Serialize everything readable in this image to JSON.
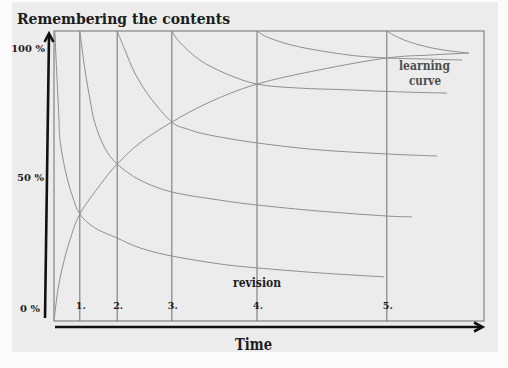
{
  "title": "Remembering the contents",
  "y_axis": {
    "tick_labels": [
      "100 %",
      "50 %",
      "0 %"
    ]
  },
  "x_axis": {
    "label": "Time"
  },
  "annotations": {
    "revision": "revision",
    "learning_curve_line1": "learning",
    "learning_curve_line2": "curve"
  },
  "colors": {
    "background": "#ececec",
    "text": "#1c1c1c",
    "annotation": "#4d4d4d",
    "curve": "#8f8f8f",
    "revision_line": "#7a7a7a",
    "frame": "#6e6e6e",
    "axis": "#111111"
  },
  "chart_data": {
    "type": "line",
    "title": "Remembering the contents",
    "xlabel": "Time",
    "ylabel": "",
    "yticks": [
      {
        "value": 100,
        "label": "100 %"
      },
      {
        "value": 50,
        "label": "50 %"
      },
      {
        "value": 0,
        "label": "0 %"
      }
    ],
    "ylim": [
      0,
      100
    ],
    "xlim": [
      0,
      100
    ],
    "grid": false,
    "legend": "none (inline annotations)",
    "revisions": [
      {
        "label": "1.",
        "t": 6.0
      },
      {
        "label": "2.",
        "t": 14.7
      },
      {
        "label": "3.",
        "t": 27.4
      },
      {
        "label": "4.",
        "t": 47.2
      },
      {
        "label": "5.",
        "t": 77.4
      }
    ],
    "annotations": [
      {
        "text": "revision",
        "near": "revision 4 line, bottom"
      },
      {
        "text": "learning curve",
        "near": "upper right, below curve ends"
      }
    ],
    "series": [
      {
        "name": "learning curve",
        "points": [
          [
            0,
            0
          ],
          [
            0.9,
            10.7
          ],
          [
            2.1,
            19.3
          ],
          [
            3.7,
            27.9
          ],
          [
            6.0,
            36.9
          ],
          [
            10.7,
            46.9
          ],
          [
            14.7,
            54.1
          ],
          [
            20.0,
            61.4
          ],
          [
            27.4,
            68.6
          ],
          [
            36.2,
            75.5
          ],
          [
            47.2,
            81.7
          ],
          [
            61.7,
            86.6
          ],
          [
            77.4,
            90.7
          ],
          [
            87.2,
            91.7
          ],
          [
            96.5,
            92.4
          ]
        ]
      },
      {
        "name": "forgetting curve initial",
        "points": [
          [
            0.2,
            100
          ],
          [
            0.6,
            86.6
          ],
          [
            1.1,
            71.7
          ],
          [
            1.4,
            62.4
          ],
          [
            2.6,
            52.1
          ],
          [
            4.2,
            43.4
          ],
          [
            6.0,
            36.9
          ],
          [
            9.5,
            32.1
          ],
          [
            14.7,
            28.6
          ],
          [
            20.0,
            25.2
          ],
          [
            27.4,
            22.4
          ],
          [
            38.5,
            19.7
          ],
          [
            47.2,
            18.3
          ],
          [
            61.7,
            16.6
          ],
          [
            76.8,
            15.2
          ]
        ]
      },
      {
        "name": "forgetting curve after revision 1",
        "points": [
          [
            6.0,
            100
          ],
          [
            7.2,
            86.6
          ],
          [
            8.4,
            76.2
          ],
          [
            9.5,
            68.3
          ],
          [
            11.8,
            59.7
          ],
          [
            14.7,
            54.1
          ],
          [
            20.0,
            48.6
          ],
          [
            27.4,
            44.5
          ],
          [
            38.5,
            41.7
          ],
          [
            47.2,
            40.0
          ],
          [
            61.7,
            37.9
          ],
          [
            77.4,
            36.2
          ],
          [
            83.3,
            35.9
          ]
        ]
      },
      {
        "name": "forgetting curve after revision 2",
        "points": [
          [
            14.7,
            100
          ],
          [
            16.5,
            93.4
          ],
          [
            18.8,
            85.5
          ],
          [
            22.3,
            77.2
          ],
          [
            27.4,
            68.6
          ],
          [
            31.0,
            66.2
          ],
          [
            36.2,
            64.1
          ],
          [
            47.2,
            61.4
          ],
          [
            61.7,
            59.0
          ],
          [
            77.4,
            57.6
          ],
          [
            89.1,
            56.9
          ]
        ]
      },
      {
        "name": "forgetting curve after revision 3",
        "points": [
          [
            27.4,
            100
          ],
          [
            29.2,
            96.2
          ],
          [
            33.9,
            90.0
          ],
          [
            39.7,
            85.5
          ],
          [
            47.2,
            81.7
          ],
          [
            57.1,
            80.3
          ],
          [
            68.7,
            79.7
          ],
          [
            80.3,
            79.0
          ],
          [
            91.4,
            78.6
          ]
        ]
      },
      {
        "name": "forgetting curve after revision 4",
        "points": [
          [
            47.2,
            100
          ],
          [
            50.1,
            97.6
          ],
          [
            57.1,
            94.5
          ],
          [
            68.7,
            91.7
          ],
          [
            77.4,
            90.7
          ],
          [
            87.2,
            90.3
          ],
          [
            94.9,
            90.0
          ]
        ]
      },
      {
        "name": "forgetting curve after revision 5",
        "points": [
          [
            77.4,
            100
          ],
          [
            80.3,
            97.6
          ],
          [
            84.9,
            95.2
          ],
          [
            90.7,
            93.4
          ],
          [
            96.5,
            92.4
          ]
        ]
      }
    ]
  }
}
